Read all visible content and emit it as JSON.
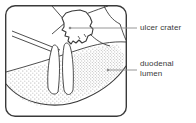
{
  "figure": {
    "type": "medical-line-illustration",
    "background_color": "#ffffff",
    "ink_color": "#3a3a3a",
    "frame": {
      "shape": "rounded-rectangle",
      "x": 5,
      "y": 5,
      "width": 122,
      "height": 112,
      "corner_radius": 10,
      "stroke_width": 1.4
    },
    "labels": [
      {
        "id": "ulcer-crater",
        "text": "ulcer crater",
        "text_x": 140,
        "text_y": 23,
        "leader": {
          "from_x": 70,
          "from_y": 28,
          "to_x": 137,
          "to_y": 28,
          "marker": "dot"
        }
      },
      {
        "id": "duodenal-lumen",
        "text_line_1": "duodenal",
        "text_line_2": "lumen",
        "text_x": 140,
        "text_y": 59,
        "leader": {
          "from_x": 108,
          "from_y": 70,
          "to_x": 137,
          "to_y": 70,
          "marker": "dot"
        }
      }
    ],
    "regions": [
      {
        "id": "ulcer-crater-outline",
        "description": "irregular jagged closed contour at upper centre of the field"
      },
      {
        "id": "duodenal-mucosa-stipple",
        "description": "stippled sloping mucosal surface filling the lower half of the field"
      },
      {
        "id": "mucosal-folds",
        "description": "two vertical rugal folds rising from the mucosal floor at left of centre"
      },
      {
        "id": "wall-edge-lines",
        "description": "paired diagonal lines at upper left marking the cut duodenal wall"
      }
    ]
  }
}
